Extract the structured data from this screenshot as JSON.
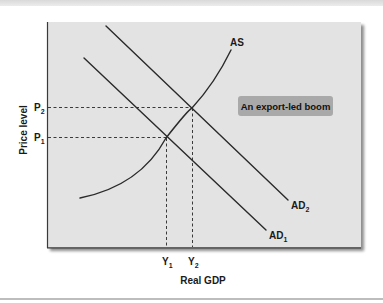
{
  "diagram": {
    "type": "AD-AS model",
    "x_axis_label": "Real GDP",
    "y_axis_label": "Price level",
    "annotation": "An export-led boom",
    "y_ticks": [
      {
        "main": "P",
        "sub": "2"
      },
      {
        "main": "P",
        "sub": "1"
      }
    ],
    "x_ticks": [
      {
        "main": "Y",
        "sub": "1"
      },
      {
        "main": "Y",
        "sub": "2"
      }
    ],
    "curves": {
      "as": {
        "label": "AS"
      },
      "ad1": {
        "main": "AD",
        "sub": "1"
      },
      "ad2": {
        "main": "AD",
        "sub": "2"
      }
    },
    "colors": {
      "plot_background": "#e3e3e3",
      "callout_background": "#a9a9a9",
      "line": "#2a2a2a"
    }
  }
}
